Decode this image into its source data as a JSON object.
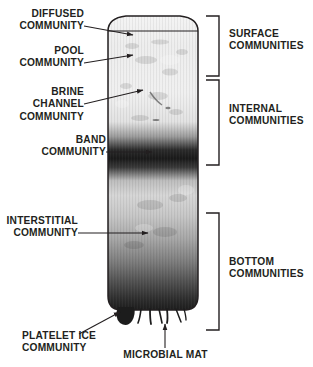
{
  "figure": {
    "ink_color": "#231f20"
  },
  "left_labels": [
    {
      "id": "diffused",
      "text": "DIFFUSED\nCOMMUNITY"
    },
    {
      "id": "pool",
      "text": "POOL\nCOMMUNITY"
    },
    {
      "id": "brine",
      "text": "BRINE CHANNEL\nCOMMUNITY"
    },
    {
      "id": "band",
      "text": "BAND\nCOMMUNITY"
    },
    {
      "id": "interstitial",
      "text": "INTERSTITIAL\nCOMMUNITY"
    },
    {
      "id": "platelet",
      "text": "PLATELET ICE\nCOMMUNITY"
    }
  ],
  "bottom_label": {
    "id": "microbial-mat",
    "text": "MICROBIAL MAT"
  },
  "bracket_labels": [
    {
      "id": "surface",
      "text": "SURFACE\nCOMMUNITIES"
    },
    {
      "id": "internal",
      "text": "INTERNAL\nCOMMUNITIES"
    },
    {
      "id": "bottom",
      "text": "BOTTOM\nCOMMUNITIES"
    }
  ]
}
